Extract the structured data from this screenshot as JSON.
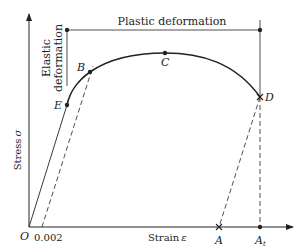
{
  "figure": {
    "title": "",
    "y_axis_label": "Stress",
    "y_axis_symbol": "σ",
    "x_axis_label": "Strain",
    "x_axis_symbol": "ε",
    "origin_label": "O",
    "offset_label": "0.002",
    "region_top": "Plastic deformation",
    "region_left_line1": "Elastic",
    "region_left_line2": "deformation",
    "points": {
      "E": "E",
      "B": "B",
      "C": "C",
      "D": "D",
      "A": "A",
      "At_main": "A",
      "At_sub": "t"
    },
    "colors": {
      "line": "#222222",
      "background": "#ffffff"
    }
  }
}
